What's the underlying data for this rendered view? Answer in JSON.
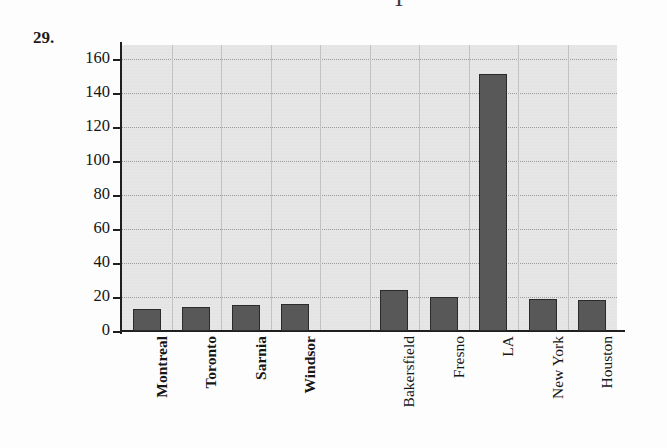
{
  "problem_number": "29.",
  "top_partial_glyph": "T",
  "chart_data": {
    "type": "bar",
    "title": "",
    "xlabel": "",
    "ylabel": "",
    "ylim": [
      0,
      168
    ],
    "yticks": [
      0,
      20,
      40,
      60,
      80,
      100,
      120,
      140,
      160
    ],
    "ytick_labels": [
      "0",
      "20",
      "40",
      "60",
      "80",
      "100",
      "120",
      "140",
      "160"
    ],
    "grid": true,
    "legend": false,
    "categories": [
      "Montreal",
      "Toronto",
      "Sarnia",
      "Windsor",
      "",
      "Bakersfield",
      "Fresno",
      "LA",
      "New York",
      "Houston"
    ],
    "values": [
      13,
      14,
      15,
      16,
      null,
      24,
      20,
      151,
      19,
      18
    ],
    "bars": [
      {
        "label": "Montreal",
        "value": 13,
        "slot": 0,
        "bold_label": true
      },
      {
        "label": "Toronto",
        "value": 14,
        "slot": 1,
        "bold_label": true
      },
      {
        "label": "Sarnia",
        "value": 15,
        "slot": 2,
        "bold_label": true
      },
      {
        "label": "Windsor",
        "value": 16,
        "slot": 3,
        "bold_label": true
      },
      {
        "label": "Bakersfield",
        "value": 24,
        "slot": 5,
        "bold_label": false
      },
      {
        "label": "Fresno",
        "value": 20,
        "slot": 6,
        "bold_label": false
      },
      {
        "label": "LA",
        "value": 151,
        "slot": 7,
        "bold_label": false
      },
      {
        "label": "New York",
        "value": 19,
        "slot": 8,
        "bold_label": false
      },
      {
        "label": "Houston",
        "value": 18,
        "slot": 9,
        "bold_label": false
      }
    ],
    "colors": {
      "bar_fill": "#585858",
      "bar_border": "#2b2b2b",
      "plot_background": "#e6e6e6",
      "gridline": "#9a9a9a",
      "axis": "#1f1f1f",
      "text": "#141414"
    }
  }
}
